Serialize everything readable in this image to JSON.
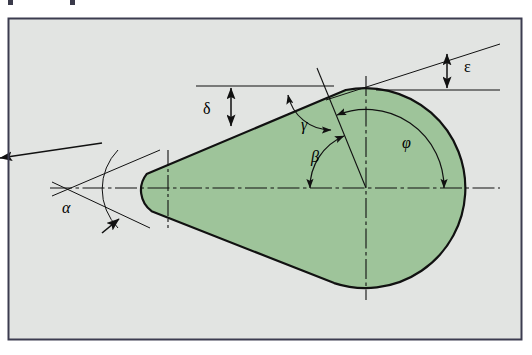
{
  "figure": {
    "frame": {
      "x": 8,
      "y": 18,
      "width": 514,
      "height": 322
    },
    "colors": {
      "shape_fill": "#9ec49a",
      "background": "#e2e4e2",
      "outline": "#111111",
      "frame_border": "#3c3c50",
      "page": "#ffffff",
      "label_color": "#000000"
    },
    "geometry": {
      "axis_y": 188,
      "small_circle": {
        "cx": 168,
        "cy": 188,
        "r": 26
      },
      "large_circle": {
        "cx": 366,
        "cy": 188,
        "r": 100
      },
      "tangent_upper": {
        "x1": 146,
        "y1": 174,
        "x2": 344,
        "y2": 90
      },
      "tangent_lower": {
        "x1": 150,
        "y1": 210,
        "x2": 330,
        "y2": 280
      },
      "radial_line": {
        "x1": 318,
        "y1": 70,
        "x2": 366,
        "y2": 188
      }
    },
    "labels": [
      {
        "id": "alpha",
        "glyph": "α",
        "name": "angle-label-alpha",
        "x": 62,
        "y": 213,
        "italic": true,
        "size": 15
      },
      {
        "id": "beta",
        "glyph": "β",
        "name": "angle-label-beta",
        "x": 311,
        "y": 160,
        "italic": true,
        "size": 15
      },
      {
        "id": "gamma",
        "glyph": "γ",
        "name": "angle-label-gamma",
        "x": 301,
        "y": 125,
        "italic": true,
        "size": 15
      },
      {
        "id": "delta",
        "glyph": "δ",
        "name": "dimension-label-delta",
        "x": 203,
        "y": 113,
        "italic": false,
        "size": 15
      },
      {
        "id": "epsilon",
        "glyph": "ε",
        "name": "dimension-label-epsilon",
        "x": 466,
        "y": 70,
        "italic": false,
        "size": 15
      },
      {
        "id": "phi",
        "glyph": "φ",
        "name": "angle-label-phi",
        "x": 404,
        "y": 146,
        "italic": true,
        "size": 15
      }
    ],
    "dimensions": {
      "delta": {
        "x": 231,
        "y_top": 86,
        "y_bottom": 126,
        "ref_line_x1": 196,
        "ref_line_x2": 330
      },
      "epsilon": {
        "x": 447,
        "y_top": 48,
        "y_bottom": 88,
        "ref_line_x1": 380,
        "ref_line_x2": 500
      }
    },
    "angle_arcs": {
      "alpha": {
        "cx": 128,
        "cy": 188,
        "r": 56,
        "start_deg": 196,
        "end_deg": 164
      },
      "beta": {
        "cx": 366,
        "cy": 188,
        "r": 56,
        "start_deg": 180,
        "end_deg": 112
      },
      "gamma": {
        "cx": 292,
        "cy": 115,
        "r": 38,
        "start_deg": 204,
        "end_deg": 338
      },
      "phi": {
        "cx": 366,
        "cy": 188,
        "r": 78,
        "start_deg": 0,
        "end_deg": 110
      }
    }
  },
  "top_marks": [
    {
      "name": "cropped-glyph-mark-1",
      "x": 8,
      "y": 0,
      "w": 5,
      "h": 5
    },
    {
      "name": "cropped-glyph-mark-2",
      "x": 70,
      "y": 0,
      "w": 5,
      "h": 5
    }
  ]
}
